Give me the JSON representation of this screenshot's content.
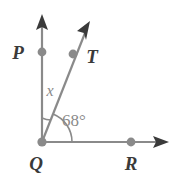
{
  "figure": {
    "type": "geometry-diagram",
    "background_color": "#ffffff",
    "line_color": "#8a8a8a",
    "point_color": "#8a8a8a",
    "arrow_color": "#3a3a3a",
    "label_color": "#3a3a3a",
    "angle_label_color": "#8a8a8a"
  },
  "points": {
    "vertex": {
      "name": "Q",
      "label": "Q",
      "x": 42,
      "y": 142
    },
    "on_vertical_ray": {
      "name": "P",
      "label": "P",
      "x": 42,
      "y": 52
    },
    "on_diagonal_ray": {
      "name": "T",
      "label": "T",
      "x": 73,
      "y": 54
    },
    "on_horizontal_ray": {
      "name": "R",
      "label": "R",
      "x": 131,
      "y": 142
    }
  },
  "labels": {
    "p": "P",
    "t": "T",
    "q": "Q",
    "r": "R"
  },
  "rays": [
    {
      "name": "ray-QP-vertical",
      "from": "Q",
      "toward": "P",
      "tip_x": 42,
      "tip_y": 15
    },
    {
      "name": "ray-QT-diagonal",
      "from": "Q",
      "toward": "T",
      "tip_x": 90,
      "tip_y": 22
    },
    {
      "name": "ray-QR-horizontal",
      "from": "Q",
      "toward": "R",
      "tip_x": 168,
      "tip_y": 142
    }
  ],
  "angles": [
    {
      "name": "angle-PQT",
      "label": "x",
      "value": "x",
      "between": [
        "ray-QP-vertical",
        "ray-QT-diagonal"
      ],
      "label_x": 50,
      "label_y": 93,
      "arc_radius": 24
    },
    {
      "name": "angle-TQR",
      "label": "68°",
      "value": 68,
      "unit": "degrees",
      "between": [
        "ray-QT-diagonal",
        "ray-QR-horizontal"
      ],
      "label_x": 62,
      "label_y": 125,
      "arc_radius": 30
    }
  ]
}
